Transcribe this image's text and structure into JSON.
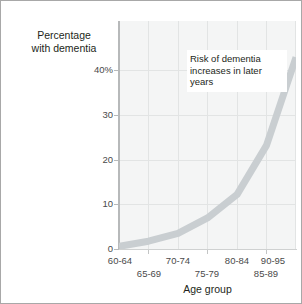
{
  "figure": {
    "border_color": "#a8a8a8",
    "background": "#ffffff"
  },
  "annotation": {
    "text": "Risk of dementia increases in later years"
  },
  "chart_data": {
    "type": "line",
    "title": "",
    "subtitle": "",
    "xlabel": "Age group",
    "ylabel": "Percentage with dementia",
    "ylabel_line1": "Percentage",
    "ylabel_line2": "with dementia",
    "categories": [
      "60-64",
      "65-69",
      "70-74",
      "75-79",
      "80-84",
      "85-89",
      "90-95"
    ],
    "values": [
      0.5,
      1.5,
      3.0,
      6.0,
      10.5,
      20.0,
      37.0
    ],
    "series": [
      {
        "name": "Percentage with dementia",
        "values": [
          0.5,
          1.5,
          3.0,
          6.0,
          10.5,
          20.0,
          37.0
        ],
        "color": "#c9ced1"
      }
    ],
    "ylim": [
      0,
      44
    ],
    "xlim": [
      0,
      6
    ],
    "yticks": [
      0,
      10,
      20,
      30,
      40
    ],
    "ytick_labels": [
      "0",
      "10",
      "20",
      "30",
      "40%"
    ],
    "xtick_labels_upper": [
      "60-64",
      "70-74",
      "80-84",
      "90-95"
    ],
    "xtick_labels_lower": [
      "65-69",
      "75-79",
      "85-89"
    ],
    "grid": true,
    "grid_color": "#e2e4e4",
    "plot_background": "#f4f5f5",
    "legend": "none",
    "annotations": [
      {
        "text": "Risk of dementia increases in later years",
        "x_category": "80-84",
        "y_value": 40
      }
    ]
  }
}
